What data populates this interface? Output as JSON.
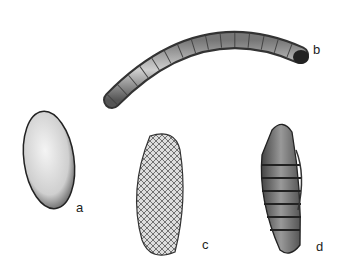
{
  "figure": {
    "panels": [
      {
        "label": "a",
        "subject": "egg"
      },
      {
        "label": "b",
        "subject": "larva"
      },
      {
        "label": "c",
        "subject": "cocoon"
      },
      {
        "label": "d",
        "subject": "pupa"
      }
    ]
  }
}
